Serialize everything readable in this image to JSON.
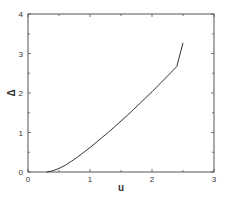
{
  "chart_data": {
    "type": "line",
    "title": "",
    "xlabel": "u",
    "ylabel": "Δ",
    "xlim": [
      0,
      3
    ],
    "ylim": [
      0,
      4
    ],
    "xticks": [
      0,
      1,
      2,
      3
    ],
    "yticks": [
      0,
      1,
      2,
      3,
      4
    ],
    "xtick_labels": [
      "0",
      "1",
      "2",
      "3"
    ],
    "ytick_labels": [
      "0",
      "1",
      "2",
      "3",
      "4"
    ],
    "grid": false,
    "legend": null,
    "series": [
      {
        "name": "Δ(u)",
        "color": "#333333",
        "x": [
          0.3,
          0.4,
          0.5,
          0.6,
          0.7,
          0.8,
          0.9,
          1.0,
          1.1,
          1.2,
          1.3,
          1.4,
          1.5,
          1.6,
          1.7,
          1.8,
          1.9,
          2.0,
          2.1,
          2.2,
          2.3,
          2.4,
          2.5
        ],
        "y": [
          0.0,
          0.03,
          0.09,
          0.17,
          0.27,
          0.38,
          0.5,
          0.62,
          0.75,
          0.88,
          1.01,
          1.15,
          1.29,
          1.43,
          1.58,
          1.73,
          1.88,
          2.03,
          2.19,
          2.35,
          2.51,
          2.67,
          3.27
        ]
      }
    ]
  },
  "plot": {
    "x_axis_label": "u",
    "y_axis_label": "Δ"
  }
}
